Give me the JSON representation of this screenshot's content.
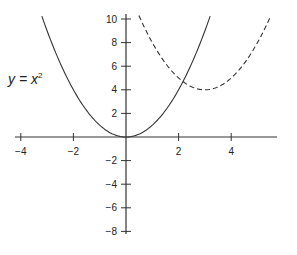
{
  "chart_data": {
    "type": "line",
    "title": "",
    "xlabel": "",
    "ylabel": "",
    "xlim": [
      -4.2,
      5.6
    ],
    "ylim": [
      -8,
      10
    ],
    "grid": false,
    "x_ticks": [
      -4,
      -2,
      2,
      4
    ],
    "x_tick_labels": [
      "−4",
      "−2",
      "2",
      "4"
    ],
    "y_ticks": [
      10,
      8,
      6,
      4,
      2,
      -2,
      -4,
      -6,
      -8
    ],
    "y_tick_labels": [
      "10",
      "8",
      "6",
      "4",
      "2",
      "−2",
      "−4",
      "−6",
      "−8"
    ],
    "series": [
      {
        "name": "y = x^2",
        "style": "solid",
        "equation": "y = x^2",
        "x": [
          -3.2,
          -3,
          -2.5,
          -2,
          -1.5,
          -1,
          -0.5,
          0,
          0.5,
          1,
          1.5,
          2,
          2.5,
          3,
          3.2
        ],
        "y": [
          10.24,
          9,
          6.25,
          4,
          2.25,
          1,
          0.25,
          0,
          0.25,
          1,
          2.25,
          4,
          6.25,
          9,
          10.24
        ]
      },
      {
        "name": "y = (x-3)^2 + 4",
        "style": "dashed",
        "equation": "y = (x-3)^2 + 4",
        "x": [
          0.5,
          1,
          1.5,
          2,
          2.5,
          3,
          3.5,
          4,
          4.5,
          5,
          5.5
        ],
        "y": [
          10.25,
          8,
          6.25,
          5,
          4.25,
          4,
          4.25,
          5,
          6.25,
          8,
          10.25
        ]
      }
    ],
    "annotations": [
      {
        "text_main": "y = x",
        "superscript": "2",
        "x": -3.9,
        "y": 5.3
      }
    ]
  }
}
